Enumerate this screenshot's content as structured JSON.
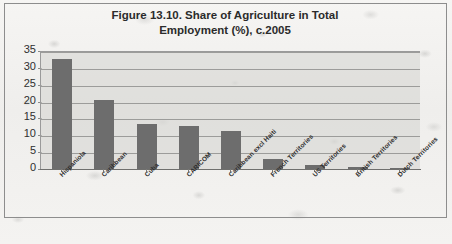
{
  "figure": {
    "title_line1": "Figure 13.10. Share of Agriculture in Total",
    "title_line2": "Employment (%), c.2005"
  },
  "chart_data": {
    "type": "bar",
    "title": "Figure 13.10. Share of Agriculture in Total Employment (%), c.2005",
    "xlabel": "",
    "ylabel": "",
    "ylim": [
      0,
      35
    ],
    "ytick_step": 5,
    "yticks": [
      "35",
      "30",
      "25",
      "20",
      "15",
      "10",
      "5",
      "0"
    ],
    "grid": true,
    "legend": false,
    "bar_color": "#6d6d6d",
    "plot_background": "#d3d3d0",
    "categories": [
      "Hispaniola",
      "Caribbean",
      "Cuba",
      "CARICOM",
      "Caribbean excl Haiti",
      "French Territories",
      "US Territories",
      "British Territories",
      "Dutch Territories"
    ],
    "values": [
      32.5,
      20.6,
      13.3,
      12.7,
      11.2,
      2.9,
      1.3,
      0.6,
      0.3
    ]
  }
}
